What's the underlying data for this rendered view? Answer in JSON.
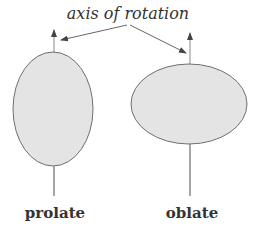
{
  "diagram": {
    "title_label": "axis of rotation",
    "shapes": [
      {
        "name": "prolate",
        "label": "prolate"
      },
      {
        "name": "oblate",
        "label": "oblate"
      }
    ]
  },
  "colors": {
    "fill": "#e4e4e4",
    "stroke": "#6f6f6f",
    "axis": "#888888",
    "text": "#333333"
  }
}
